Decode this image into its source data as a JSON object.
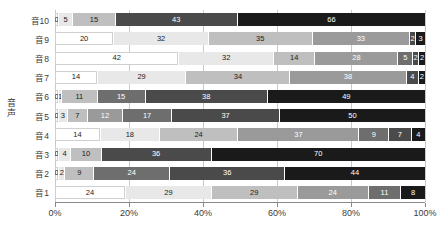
{
  "chart_data": {
    "type": "bar",
    "orientation": "horizontal",
    "stacked": true,
    "normalized_percent": true,
    "title": "",
    "xlabel": "",
    "ylabel": "音声",
    "xlim": [
      0,
      100
    ],
    "grid": true,
    "legend": null,
    "xticks": [
      "0%",
      "20%",
      "40%",
      "60%",
      "80%",
      "100%"
    ],
    "xtick_values": [
      0,
      20,
      40,
      60,
      80,
      100
    ],
    "categories": [
      "音1",
      "音2",
      "音3",
      "音4",
      "音5",
      "音6",
      "音7",
      "音8",
      "音9",
      "音10"
    ],
    "series": [
      {
        "name": "s1",
        "color": "#ffffff",
        "text_color": "#1a1a1a",
        "values": [
          24,
          0,
          0,
          14,
          0,
          0,
          14,
          42,
          20,
          0
        ]
      },
      {
        "name": "s2",
        "color": "#e8e8e8",
        "text_color": "#1a1a1a",
        "values": [
          29,
          2,
          4,
          18,
          3,
          1,
          29,
          32,
          32,
          5
        ]
      },
      {
        "name": "s3",
        "color": "#bfbfbf",
        "text_color": "#1a1a1a",
        "values": [
          29,
          9,
          10,
          24,
          7,
          11,
          34,
          14,
          35,
          15
        ]
      },
      {
        "name": "s4",
        "color": "#9a9a9a",
        "text_color": "#ffffff",
        "values": [
          24,
          24,
          36,
          37,
          12,
          15,
          38,
          28,
          33,
          43
        ]
      },
      {
        "name": "s5",
        "color": "#6e6e6e",
        "text_color": "#ffffff",
        "values": [
          11,
          36,
          0,
          9,
          17,
          0,
          4,
          5,
          2,
          0
        ]
      },
      {
        "name": "s6",
        "color": "#4a4a4a",
        "text_color": "#ffffff",
        "values": [
          8,
          0,
          0,
          7,
          37,
          38,
          0,
          2,
          2,
          0
        ]
      },
      {
        "name": "s7",
        "color": "#1a1a1a",
        "text_color": "#ffffff",
        "values": [
          0,
          44,
          70,
          4,
          50,
          49,
          2,
          2,
          3,
          66
        ]
      }
    ],
    "row_order_top_to_bottom": [
      "音10",
      "音9",
      "音8",
      "音7",
      "音6",
      "音5",
      "音4",
      "音3",
      "音2",
      "音1"
    ],
    "rows": [
      {
        "category": "音10",
        "segments": [
          {
            "value": 0,
            "label": "0",
            "color": "#ffffff",
            "text_color": "#1a1a1a"
          },
          {
            "value": 5,
            "label": "5",
            "color": "#e8e8e8",
            "text_color": "#1a1a1a"
          },
          {
            "value": 15,
            "label": "15",
            "color": "#bfbfbf",
            "text_color": "#1a1a1a"
          },
          {
            "value": 43,
            "label": "43",
            "color": "#4a4a4a",
            "text_color": "#ffffff"
          },
          {
            "value": 66,
            "label": "66",
            "color": "#1a1a1a",
            "text_color": "#ffffff"
          }
        ]
      },
      {
        "category": "音9",
        "segments": [
          {
            "value": 20,
            "label": "20",
            "color": "#ffffff",
            "text_color": "#1a1a1a"
          },
          {
            "value": 32,
            "label": "32",
            "color": "#e8e8e8",
            "text_color": "#1a1a1a"
          },
          {
            "value": 35,
            "label": "35",
            "color": "#bfbfbf",
            "text_color": "#1a1a1a"
          },
          {
            "value": 33,
            "label": "33",
            "color": "#9a9a9a",
            "text_color": "#ffffff"
          },
          {
            "value": 2,
            "label": "2",
            "color": "#4a4a4a",
            "text_color": "#ffffff"
          },
          {
            "value": 3,
            "label": "3",
            "color": "#1a1a1a",
            "text_color": "#ffffff"
          }
        ]
      },
      {
        "category": "音8",
        "segments": [
          {
            "value": 42,
            "label": "42",
            "color": "#ffffff",
            "text_color": "#1a1a1a"
          },
          {
            "value": 32,
            "label": "32",
            "color": "#e8e8e8",
            "text_color": "#1a1a1a"
          },
          {
            "value": 14,
            "label": "14",
            "color": "#bfbfbf",
            "text_color": "#1a1a1a"
          },
          {
            "value": 28,
            "label": "28",
            "color": "#9a9a9a",
            "text_color": "#ffffff"
          },
          {
            "value": 5,
            "label": "5",
            "color": "#6e6e6e",
            "text_color": "#ffffff"
          },
          {
            "value": 2,
            "label": "2",
            "color": "#4a4a4a",
            "text_color": "#ffffff"
          },
          {
            "value": 2,
            "label": "2",
            "color": "#1a1a1a",
            "text_color": "#ffffff"
          }
        ]
      },
      {
        "category": "音7",
        "segments": [
          {
            "value": 14,
            "label": "14",
            "color": "#ffffff",
            "text_color": "#1a1a1a"
          },
          {
            "value": 29,
            "label": "29",
            "color": "#e8e8e8",
            "text_color": "#1a1a1a"
          },
          {
            "value": 34,
            "label": "34",
            "color": "#bfbfbf",
            "text_color": "#1a1a1a"
          },
          {
            "value": 38,
            "label": "38",
            "color": "#9a9a9a",
            "text_color": "#ffffff"
          },
          {
            "value": 4,
            "label": "4",
            "color": "#4a4a4a",
            "text_color": "#ffffff"
          },
          {
            "value": 2,
            "label": "2",
            "color": "#1a1a1a",
            "text_color": "#ffffff"
          }
        ]
      },
      {
        "category": "音6",
        "segments": [
          {
            "value": 0,
            "label": "0",
            "color": "#ffffff",
            "text_color": "#1a1a1a"
          },
          {
            "value": 1,
            "label": "1",
            "color": "#e8e8e8",
            "text_color": "#1a1a1a"
          },
          {
            "value": 11,
            "label": "11",
            "color": "#bfbfbf",
            "text_color": "#1a1a1a"
          },
          {
            "value": 15,
            "label": "15",
            "color": "#6e6e6e",
            "text_color": "#ffffff"
          },
          {
            "value": 38,
            "label": "38",
            "color": "#4a4a4a",
            "text_color": "#ffffff"
          },
          {
            "value": 49,
            "label": "49",
            "color": "#1a1a1a",
            "text_color": "#ffffff"
          }
        ]
      },
      {
        "category": "音5",
        "segments": [
          {
            "value": 0,
            "label": "0",
            "color": "#ffffff",
            "text_color": "#1a1a1a"
          },
          {
            "value": 3,
            "label": "3",
            "color": "#e8e8e8",
            "text_color": "#1a1a1a"
          },
          {
            "value": 7,
            "label": "7",
            "color": "#bfbfbf",
            "text_color": "#1a1a1a"
          },
          {
            "value": 12,
            "label": "12",
            "color": "#9a9a9a",
            "text_color": "#ffffff"
          },
          {
            "value": 17,
            "label": "17",
            "color": "#6e6e6e",
            "text_color": "#ffffff"
          },
          {
            "value": 37,
            "label": "37",
            "color": "#4a4a4a",
            "text_color": "#ffffff"
          },
          {
            "value": 50,
            "label": "50",
            "color": "#1a1a1a",
            "text_color": "#ffffff"
          }
        ]
      },
      {
        "category": "音4",
        "segments": [
          {
            "value": 14,
            "label": "14",
            "color": "#ffffff",
            "text_color": "#1a1a1a"
          },
          {
            "value": 18,
            "label": "18",
            "color": "#e8e8e8",
            "text_color": "#1a1a1a"
          },
          {
            "value": 24,
            "label": "24",
            "color": "#bfbfbf",
            "text_color": "#1a1a1a"
          },
          {
            "value": 37,
            "label": "37",
            "color": "#9a9a9a",
            "text_color": "#ffffff"
          },
          {
            "value": 9,
            "label": "9",
            "color": "#6e6e6e",
            "text_color": "#ffffff"
          },
          {
            "value": 7,
            "label": "7",
            "color": "#4a4a4a",
            "text_color": "#ffffff"
          },
          {
            "value": 4,
            "label": "4",
            "color": "#1a1a1a",
            "text_color": "#ffffff"
          }
        ]
      },
      {
        "category": "音3",
        "segments": [
          {
            "value": 0,
            "label": "0",
            "color": "#ffffff",
            "text_color": "#1a1a1a"
          },
          {
            "value": 4,
            "label": "4",
            "color": "#e8e8e8",
            "text_color": "#1a1a1a"
          },
          {
            "value": 10,
            "label": "10",
            "color": "#bfbfbf",
            "text_color": "#1a1a1a"
          },
          {
            "value": 36,
            "label": "36",
            "color": "#4a4a4a",
            "text_color": "#ffffff"
          },
          {
            "value": 70,
            "label": "70",
            "color": "#1a1a1a",
            "text_color": "#ffffff"
          }
        ]
      },
      {
        "category": "音2",
        "segments": [
          {
            "value": 0,
            "label": "0",
            "color": "#ffffff",
            "text_color": "#1a1a1a"
          },
          {
            "value": 2,
            "label": "2",
            "color": "#e8e8e8",
            "text_color": "#1a1a1a"
          },
          {
            "value": 9,
            "label": "9",
            "color": "#bfbfbf",
            "text_color": "#1a1a1a"
          },
          {
            "value": 24,
            "label": "24",
            "color": "#6e6e6e",
            "text_color": "#ffffff"
          },
          {
            "value": 36,
            "label": "36",
            "color": "#4a4a4a",
            "text_color": "#ffffff"
          },
          {
            "value": 44,
            "label": "44",
            "color": "#1a1a1a",
            "text_color": "#ffffff"
          }
        ]
      },
      {
        "category": "音1",
        "segments": [
          {
            "value": 24,
            "label": "24",
            "color": "#ffffff",
            "text_color": "#1a1a1a"
          },
          {
            "value": 29,
            "label": "29",
            "color": "#e8e8e8",
            "text_color": "#1a1a1a"
          },
          {
            "value": 29,
            "label": "29",
            "color": "#bfbfbf",
            "text_color": "#1a1a1a"
          },
          {
            "value": 24,
            "label": "24",
            "color": "#9a9a9a",
            "text_color": "#ffffff"
          },
          {
            "value": 11,
            "label": "11",
            "color": "#6e6e6e",
            "text_color": "#ffffff"
          },
          {
            "value": 8,
            "label": "8",
            "color": "#1a1a1a",
            "text_color": "#ffffff"
          }
        ]
      }
    ]
  }
}
